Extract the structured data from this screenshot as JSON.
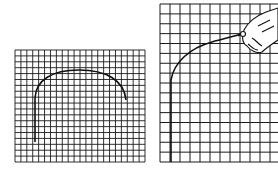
{
  "figure": {
    "colors": {
      "ink": "#1a1a1a",
      "background": "#ffffff"
    },
    "left_panel": {
      "label": "small-grid-arch",
      "x": 15,
      "y": 50,
      "width": 130,
      "height": 112,
      "cols": 22,
      "rows": 19
    },
    "right_panel": {
      "label": "large-grid-hand-drawing",
      "x": 160,
      "y": 4,
      "width": 130,
      "height": 158,
      "cols": 13,
      "rows": 16
    }
  }
}
